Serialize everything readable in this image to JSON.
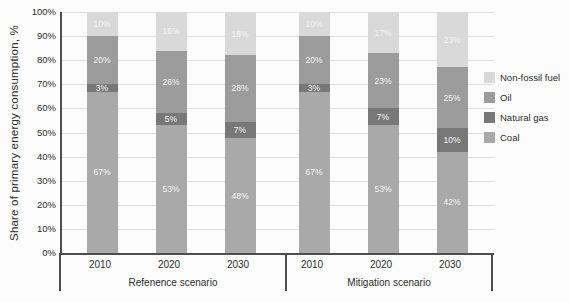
{
  "chart_data": {
    "type": "bar",
    "subtype": "stacked-100-percent",
    "title": "",
    "ylabel": "Share of primary energy consumption, %",
    "xlabel": "",
    "ylim": [
      0,
      100
    ],
    "ytick_labels": [
      "0%",
      "10%",
      "20%",
      "30%",
      "40%",
      "50%",
      "60%",
      "70%",
      "80%",
      "90%",
      "100%"
    ],
    "grid": "horizontal",
    "legend_position": "right",
    "legend": [
      {
        "key": "non_fossil",
        "label": "Non-fossil fuel",
        "color": "#d9d9d9"
      },
      {
        "key": "oil",
        "label": "Oil",
        "color": "#9c9c9c"
      },
      {
        "key": "natural_gas",
        "label": "Natural gas",
        "color": "#787878"
      },
      {
        "key": "coal",
        "label": "Coal",
        "color": "#a9a9a9"
      }
    ],
    "stack_order_bottom_to_top": [
      "coal",
      "natural_gas",
      "oil",
      "non_fossil"
    ],
    "groups": [
      {
        "label": "Refenence scenario",
        "years": [
          "2010",
          "2020",
          "2030"
        ]
      },
      {
        "label": "Mitigation scenario",
        "years": [
          "2010",
          "2020",
          "2030"
        ]
      }
    ],
    "bars": [
      {
        "group": 0,
        "year": "2010",
        "values": {
          "coal": 67,
          "natural_gas": 3,
          "oil": 20,
          "non_fossil": 10
        }
      },
      {
        "group": 0,
        "year": "2020",
        "values": {
          "coal": 53,
          "natural_gas": 5,
          "oil": 26,
          "non_fossil": 16
        }
      },
      {
        "group": 0,
        "year": "2030",
        "values": {
          "coal": 48,
          "natural_gas": 7,
          "oil": 28,
          "non_fossil": 18
        }
      },
      {
        "group": 1,
        "year": "2010",
        "values": {
          "coal": 67,
          "natural_gas": 3,
          "oil": 20,
          "non_fossil": 10
        }
      },
      {
        "group": 1,
        "year": "2020",
        "values": {
          "coal": 53,
          "natural_gas": 7,
          "oil": 23,
          "non_fossil": 17
        }
      },
      {
        "group": 1,
        "year": "2030",
        "values": {
          "coal": 42,
          "natural_gas": 10,
          "oil": 25,
          "non_fossil": 23
        }
      }
    ],
    "segment_label_suffix": "%"
  }
}
